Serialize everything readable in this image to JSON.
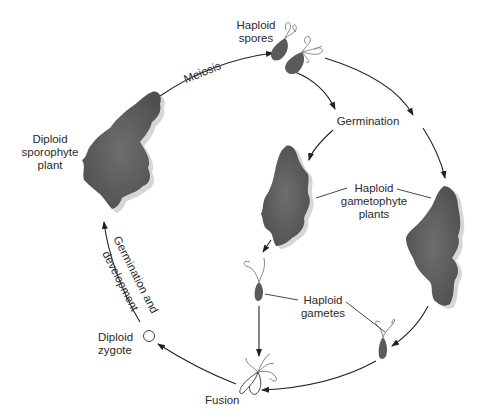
{
  "diagram": {
    "labels": {
      "haploid_spores": "Haploid\nspores",
      "meiosis": "Meiosis",
      "diploid_sporophyte": "Diploid\nsporophyte\nplant",
      "germination": "Germination",
      "haploid_gametophyte": "Haploid\ngametophyte\nplants",
      "haploid_gametes": "Haploid\ngametes",
      "germination_and_development_line1": "Germination and",
      "germination_and_development_line2": "development",
      "diploid_zygote": "Diploid\nzygote",
      "fusion": "Fusion"
    },
    "stages": [
      {
        "id": "sporophyte",
        "name": "Diploid sporophyte plant"
      },
      {
        "id": "spores",
        "name": "Haploid spores"
      },
      {
        "id": "gametophytes",
        "name": "Haploid gametophyte plants"
      },
      {
        "id": "gametes",
        "name": "Haploid gametes"
      },
      {
        "id": "fusion",
        "name": "Fusion"
      },
      {
        "id": "zygote",
        "name": "Diploid zygote"
      }
    ],
    "colors": {
      "plant_fill": "#5e5e5e",
      "plant_shadow": "#d8d8d8",
      "line": "#222222",
      "text": "#2a2a2a"
    }
  }
}
